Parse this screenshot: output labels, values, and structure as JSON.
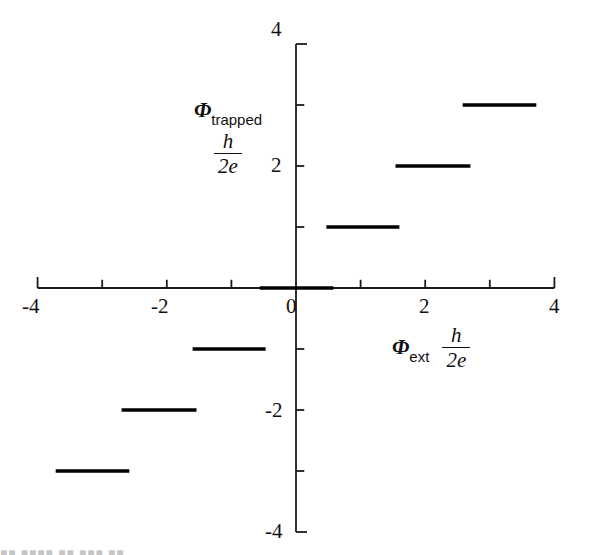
{
  "chart_data": {
    "type": "line",
    "title": "",
    "subtitle": "",
    "xlabel": "Φext h/2e",
    "ylabel": "Φtrapped h/2e",
    "xlabel_symbol": "Φ",
    "xlabel_subscript": "ext",
    "xlabel_fraction_numerator": "h",
    "xlabel_fraction_denominator": "2e",
    "ylabel_symbol": "Φ",
    "ylabel_subscript": "trapped",
    "ylabel_fraction_numerator": "h",
    "ylabel_fraction_denominator": "2e",
    "xlim": [
      -4,
      4
    ],
    "ylim": [
      -4,
      4
    ],
    "grid": false,
    "legend": null,
    "x_major_ticks": [
      -4,
      -2,
      0,
      2,
      4
    ],
    "x_minor_ticks": [
      -3,
      -1,
      1,
      3
    ],
    "y_major_ticks": [
      -4,
      -2,
      0,
      2,
      4
    ],
    "y_minor_ticks": [
      -3,
      -1,
      1,
      3
    ],
    "x_tick_labels": [
      "-4",
      "-2",
      "0",
      "2",
      "4"
    ],
    "y_tick_labels": [
      "-4",
      "-2",
      "0",
      "2",
      "4"
    ],
    "line_color": "#000000",
    "axis_color": "#1a1a1a",
    "steps": [
      {
        "level": 3,
        "x_start": 2.58,
        "x_end": 3.72
      },
      {
        "level": 2,
        "x_start": 1.54,
        "x_end": 2.7
      },
      {
        "level": 1,
        "x_start": 0.47,
        "x_end": 1.6
      },
      {
        "level": 0,
        "x_start": -0.56,
        "x_end": 0.58
      },
      {
        "level": -1,
        "x_start": -1.6,
        "x_end": -0.47
      },
      {
        "level": -2,
        "x_start": -2.7,
        "x_end": -1.54
      },
      {
        "level": -3,
        "x_start": -3.72,
        "x_end": -2.58
      }
    ]
  },
  "geometry": {
    "origin_x_px": 296,
    "origin_y_px": 288,
    "px_per_unit_x": 64.6,
    "px_per_unit_y": 61.0,
    "tick_len_px": 11,
    "axis_stroke_px": 1.8,
    "step_stroke_px": 3.4
  },
  "artifact": {
    "bottom_text": "■■ ■■■■  ■■ ■■■ ■■"
  }
}
